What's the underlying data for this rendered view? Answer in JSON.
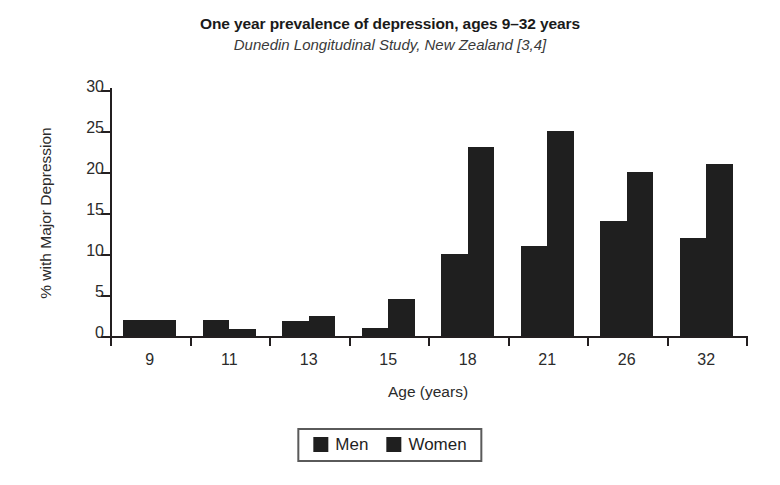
{
  "chart_data": {
    "type": "bar",
    "title": "One year prevalence of depression, ages 9–32 years",
    "subtitle": "Dunedin Longitudinal Study, New Zealand [3,4]",
    "xlabel": "Age (years)",
    "ylabel": "% with Major Depression",
    "categories": [
      "9",
      "11",
      "13",
      "15",
      "18",
      "21",
      "26",
      "32"
    ],
    "series": [
      {
        "name": "Men",
        "color": "#1f1f1f",
        "values": [
          2,
          2,
          1.8,
          1,
          10,
          11,
          14,
          12
        ]
      },
      {
        "name": "Women",
        "color": "#1f1f1f",
        "values": [
          2,
          0.9,
          2.5,
          4.5,
          23,
          25,
          20,
          21
        ]
      }
    ],
    "ylim": [
      0,
      30
    ],
    "yticks": [
      0,
      5,
      10,
      15,
      20,
      25,
      30
    ],
    "ytick_labels": [
      "0",
      "5",
      "10",
      "15",
      "20",
      "25",
      "30"
    ],
    "grid": false,
    "legend_position": "bottom-center"
  },
  "legend": {
    "entries": [
      {
        "label": "Men",
        "swatch_color": "#1f1f1f"
      },
      {
        "label": "Women",
        "swatch_color": "#1f1f1f"
      }
    ]
  }
}
